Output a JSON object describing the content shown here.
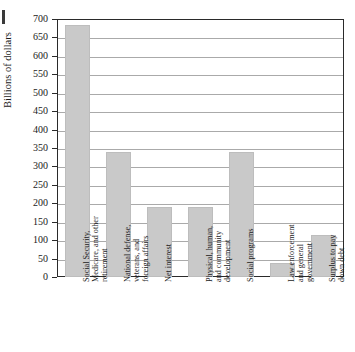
{
  "chart_data": {
    "type": "bar",
    "title": "",
    "xlabel": "",
    "ylabel": "Billions of dollars",
    "ylim": [
      0,
      700
    ],
    "ytick_step": 50,
    "grid": true,
    "legend": false,
    "categories": [
      "Social Security, Medicare, and other retirement",
      "National defense, veterans, and foreign affairs",
      "Net interest",
      "Physical, human, and community development",
      "Social programs",
      "Law enforcement and general government",
      "Surplus to pay down debt"
    ],
    "values": [
      683,
      340,
      190,
      190,
      340,
      37,
      113
    ],
    "yticks": [
      0,
      50,
      100,
      150,
      200,
      250,
      300,
      350,
      400,
      450,
      500,
      550,
      600,
      650,
      700
    ],
    "ytick_labels": [
      "0",
      "50",
      "100",
      "150",
      "200",
      "250",
      "300",
      "350",
      "400",
      "450",
      "500",
      "550",
      "600",
      "650",
      "700"
    ],
    "bar_color": "#c9c9c9",
    "axis_color": "#2a2a2a",
    "grid_color": "#aaaaaa"
  },
  "axis": {
    "y_title": "Billions of dollars"
  }
}
